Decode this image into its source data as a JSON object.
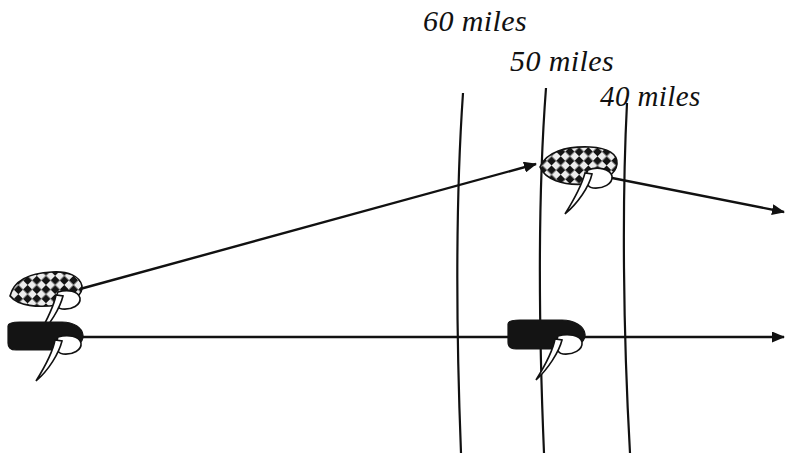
{
  "figure": {
    "background_color": "#ffffff",
    "line_color": "#111111",
    "width": 802,
    "height": 453
  },
  "range_labels": [
    {
      "id": "label-60",
      "text": "60 miles",
      "x": 423,
      "y": 4
    },
    {
      "id": "label-50",
      "text": "50 miles",
      "x": 510,
      "y": 44
    },
    {
      "id": "label-40",
      "text": "40 miles",
      "x": 600,
      "y": 80
    }
  ],
  "range_lines": [
    {
      "name": "range-line-60",
      "top_x": 463,
      "top_y": 93,
      "bottom_x": 461,
      "bottom_y": 453
    },
    {
      "name": "range-line-50",
      "top_x": 546,
      "top_y": 88,
      "bottom_x": 544,
      "bottom_y": 453
    },
    {
      "name": "range-line-40",
      "top_x": 627,
      "top_y": 103,
      "bottom_x": 630,
      "bottom_y": 453
    }
  ],
  "tracks": [
    {
      "name": "own-ship-track",
      "style": "horizontal",
      "start_x": 80,
      "start_y": 337,
      "end_x": 786,
      "end_y": 337,
      "arrowhead": "right"
    },
    {
      "name": "target-ship-track",
      "style": "diagonal",
      "start_x": 80,
      "start_y": 289,
      "mid_x": 540,
      "mid_y": 163,
      "end_x": 786,
      "end_y": 212,
      "arrowhead": "both-segments"
    }
  ],
  "vessels": [
    {
      "name": "vessel-target-start",
      "hull": "checkered",
      "x": 10,
      "y": 272,
      "width": 72,
      "height": 36,
      "rotation": -8
    },
    {
      "name": "vessel-own-start",
      "hull": "solid",
      "x": 8,
      "y": 320,
      "width": 76,
      "height": 34,
      "rotation": 0
    },
    {
      "name": "vessel-target-end",
      "hull": "checkered",
      "x": 540,
      "y": 146,
      "width": 76,
      "height": 38,
      "rotation": -7
    },
    {
      "name": "vessel-own-end",
      "hull": "solid",
      "x": 508,
      "y": 318,
      "width": 78,
      "height": 34,
      "rotation": 0
    }
  ],
  "colors": {
    "ink": "#111111",
    "hull_dark": "#141414",
    "hull_light": "#e8e8e8"
  }
}
